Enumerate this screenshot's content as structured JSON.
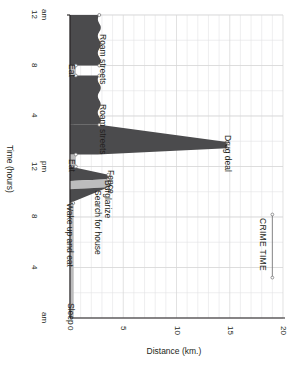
{
  "chart_data": {
    "type": "area",
    "title": "",
    "subtitle": "",
    "orientation": "rotated-90",
    "xlabel": "Distance (km.)",
    "ylabel": "Time (hours)",
    "xlim": [
      0,
      20
    ],
    "ylim": [
      0,
      24
    ],
    "xticks": [
      "0",
      "5",
      "10",
      "15",
      "20"
    ],
    "xtick_values": [
      0,
      5,
      10,
      15,
      20
    ],
    "yticks": [
      "12 am",
      "8",
      "4",
      "12 pm",
      "8",
      "4",
      "am"
    ],
    "ytick_labels": [
      {
        "label": "12",
        "suffix": "am",
        "hour": 24
      },
      {
        "label": "8",
        "suffix": "",
        "hour": 20
      },
      {
        "label": "4",
        "suffix": "",
        "hour": 16
      },
      {
        "label": "12",
        "suffix": "pm",
        "hour": 12
      },
      {
        "label": "8",
        "suffix": "",
        "hour": 8
      },
      {
        "label": "4",
        "suffix": "",
        "hour": 4
      },
      {
        "label": "",
        "suffix": "am",
        "hour": 0
      }
    ],
    "grid": true,
    "grid_major_km": 5,
    "grid_minor_km": 1,
    "series": [
      {
        "name": "Distance from home",
        "x": [
          0,
          7.6,
          7.6,
          8.4,
          8.7,
          9.4,
          10.0,
          10.6,
          10.9,
          11.5,
          11.8,
          12.4,
          13.0,
          13.2,
          14.8,
          15.2,
          18.9,
          19.4,
          22.1,
          24.0
        ],
        "values": [
          0,
          0,
          0.3,
          0.3,
          2.2,
          2.0,
          3.9,
          3.8,
          2.6,
          2.6,
          0.5,
          0.5,
          2.8,
          2.8,
          14.7,
          2.9,
          2.9,
          0.4,
          2.8,
          2.8
        ]
      }
    ],
    "annotations": [
      {
        "text": "Roam streets",
        "km": 3.5,
        "hour": 22.2
      },
      {
        "text": "Eat",
        "km": 0.6,
        "hour": 19.8
      },
      {
        "text": "Roam streets",
        "km": 3.5,
        "hour": 16.6
      },
      {
        "text": "Drug deal",
        "km": 15.2,
        "hour": 14.2
      },
      {
        "text": "Eat",
        "km": 0.6,
        "hour": 12.3
      },
      {
        "text": "Fence",
        "km": 4.2,
        "hour": 11.4
      },
      {
        "text": "Burglarize",
        "km": 3.9,
        "hour": 10.6
      },
      {
        "text": "Search for house",
        "km": 3.0,
        "hour": 9.8
      },
      {
        "text": "Wake up and eat",
        "km": 0.4,
        "hour": 8.8
      },
      {
        "text": "Sleep",
        "km": 0.5,
        "hour": 0.9
      }
    ],
    "bracket": {
      "label": "CRIME TIME",
      "km": 19.0,
      "hour_start": 8.2,
      "hour_end": 3.2
    },
    "colors": {
      "fill_dark": "#4b4b4d",
      "fill_light": "#bcbcbd",
      "axis": "#231f20",
      "grid": "#e3e3e4",
      "grid_major": "#d5d5d6",
      "marker_stroke": "#6d6d6f",
      "marker_fill": "#ffffff",
      "text": "#231f20"
    }
  }
}
